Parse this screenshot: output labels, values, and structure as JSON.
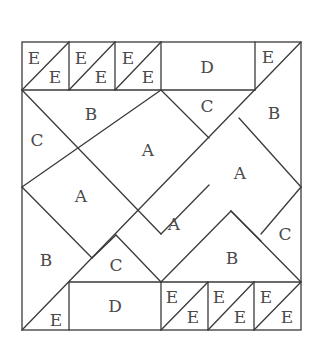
{
  "diagram": {
    "stroke_color": "#3a3a3a",
    "label_color": "#4a4a4a",
    "labels": [
      {
        "id": "e-top-1a",
        "text": "E",
        "x": 34,
        "y": 58
      },
      {
        "id": "e-top-1b",
        "text": "E",
        "x": 55,
        "y": 77
      },
      {
        "id": "e-top-2a",
        "text": "E",
        "x": 81,
        "y": 58
      },
      {
        "id": "e-top-2b",
        "text": "E",
        "x": 101,
        "y": 77
      },
      {
        "id": "e-top-3a",
        "text": "E",
        "x": 128,
        "y": 58
      },
      {
        "id": "e-top-3b",
        "text": "E",
        "x": 148,
        "y": 77
      },
      {
        "id": "d-top",
        "text": "D",
        "x": 207,
        "y": 67
      },
      {
        "id": "e-top-right",
        "text": "E",
        "x": 268,
        "y": 57
      },
      {
        "id": "b-top-left",
        "text": "B",
        "x": 91,
        "y": 114
      },
      {
        "id": "c-top",
        "text": "C",
        "x": 207,
        "y": 106
      },
      {
        "id": "b-top-right",
        "text": "B",
        "x": 274,
        "y": 113
      },
      {
        "id": "c-left",
        "text": "C",
        "x": 37,
        "y": 140
      },
      {
        "id": "a-upper-center",
        "text": "A",
        "x": 148,
        "y": 150
      },
      {
        "id": "a-right",
        "text": "A",
        "x": 240,
        "y": 173
      },
      {
        "id": "a-left",
        "text": "A",
        "x": 81,
        "y": 196
      },
      {
        "id": "a-lower-center",
        "text": "A",
        "x": 174,
        "y": 224
      },
      {
        "id": "c-right",
        "text": "C",
        "x": 285,
        "y": 234
      },
      {
        "id": "b-bottom-left",
        "text": "B",
        "x": 46,
        "y": 260
      },
      {
        "id": "c-bottom",
        "text": "C",
        "x": 116,
        "y": 265
      },
      {
        "id": "b-bottom-right",
        "text": "B",
        "x": 232,
        "y": 258
      },
      {
        "id": "e-bottom-left",
        "text": "E",
        "x": 56,
        "y": 320
      },
      {
        "id": "d-bottom",
        "text": "D",
        "x": 115,
        "y": 306
      },
      {
        "id": "e-bot-1a",
        "text": "E",
        "x": 172,
        "y": 297
      },
      {
        "id": "e-bot-1b",
        "text": "E",
        "x": 193,
        "y": 317
      },
      {
        "id": "e-bot-2a",
        "text": "E",
        "x": 219,
        "y": 297
      },
      {
        "id": "e-bot-2b",
        "text": "E",
        "x": 240,
        "y": 317
      },
      {
        "id": "e-bot-3a",
        "text": "E",
        "x": 266,
        "y": 297
      },
      {
        "id": "e-bot-3b",
        "text": "E",
        "x": 287,
        "y": 317
      }
    ]
  }
}
